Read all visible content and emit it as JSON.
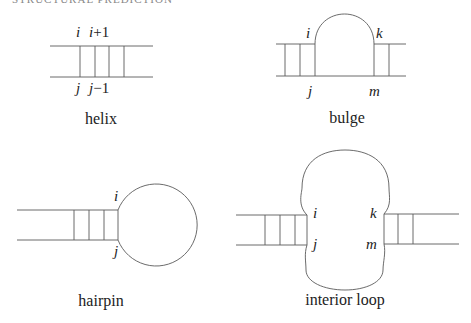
{
  "header": {
    "text": "STRUCTURAL PREDICTION"
  },
  "panels": {
    "helix": {
      "caption": "helix",
      "labels": {
        "top_1": "i",
        "top_2_var": "i",
        "top_2_rest": "+1",
        "bottom_1": "j",
        "bottom_2_var": "j",
        "bottom_2_rest": "−1"
      }
    },
    "bulge": {
      "caption": "bulge",
      "labels": {
        "i": "i",
        "k": "k",
        "j": "j",
        "m": "m"
      }
    },
    "hairpin": {
      "caption": "hairpin",
      "labels": {
        "i": "i",
        "j": "j"
      }
    },
    "interior_loop": {
      "caption": "interior loop",
      "labels": {
        "i": "i",
        "j": "j",
        "k": "k",
        "m": "m"
      }
    }
  },
  "colors": {
    "line": "#5a5a5a",
    "text": "#222222"
  }
}
